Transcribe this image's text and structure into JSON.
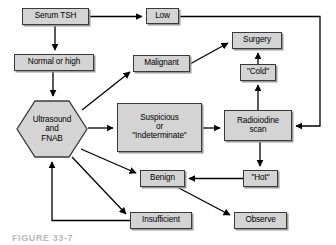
{
  "figure": {
    "caption": "FIGURE 33-7",
    "colors": {
      "node_fill": "#d4d4d4",
      "node_border": "#3a3a3a",
      "edge": "#000000",
      "background": "#ffffff"
    }
  },
  "nodes": [
    {
      "id": "serum-tsh",
      "label": "Serum TSH",
      "shape": "rect",
      "x": 22,
      "y": 8,
      "w": 67,
      "h": 17
    },
    {
      "id": "low",
      "label": "Low",
      "shape": "rect",
      "x": 146,
      "y": 8,
      "w": 33,
      "h": 16
    },
    {
      "id": "normal-or-high",
      "label": "Normal or high",
      "shape": "rect",
      "x": 14,
      "y": 54,
      "w": 80,
      "h": 17
    },
    {
      "id": "malignant",
      "label": "Malignant",
      "shape": "rect",
      "x": 133,
      "y": 55,
      "w": 57,
      "h": 17
    },
    {
      "id": "surgery",
      "label": "Surgery",
      "shape": "rect",
      "x": 232,
      "y": 32,
      "w": 50,
      "h": 17
    },
    {
      "id": "cold",
      "label": "\"Cold\"",
      "shape": "rect",
      "x": 240,
      "y": 64,
      "w": 36,
      "h": 17
    },
    {
      "id": "ultrasound-fnab",
      "label": "Ultrasound\nand\nFNAB",
      "shape": "hexagon",
      "x": 16,
      "y": 100,
      "w": 72,
      "h": 58
    },
    {
      "id": "suspicious",
      "label": "Suspicious\nor\n\"Indeterminate\"",
      "shape": "rect",
      "x": 117,
      "y": 103,
      "w": 85,
      "h": 49
    },
    {
      "id": "radioiodine-scan",
      "label": "Radioiodine\nscan",
      "shape": "rect",
      "x": 224,
      "y": 110,
      "w": 68,
      "h": 31
    },
    {
      "id": "benign",
      "label": "Benign",
      "shape": "rect",
      "x": 140,
      "y": 170,
      "w": 45,
      "h": 17
    },
    {
      "id": "hot",
      "label": "\"Hot\"",
      "shape": "rect",
      "x": 243,
      "y": 170,
      "w": 35,
      "h": 17
    },
    {
      "id": "insufficient",
      "label": "Insufficient",
      "shape": "rect",
      "x": 130,
      "y": 212,
      "w": 62,
      "h": 17
    },
    {
      "id": "observe",
      "label": "Observe",
      "shape": "rect",
      "x": 234,
      "y": 212,
      "w": 53,
      "h": 17
    }
  ],
  "edges": [
    {
      "id": "serum-tsh-to-low",
      "from": "serum-tsh",
      "to": "low",
      "style": "orthogonal"
    },
    {
      "id": "serum-tsh-to-normal-or-high",
      "from": "serum-tsh",
      "to": "normal-or-high",
      "style": "orthogonal"
    },
    {
      "id": "normal-or-high-to-ultrasound",
      "from": "normal-or-high",
      "to": "ultrasound-fnab",
      "style": "orthogonal"
    },
    {
      "id": "ultrasound-to-malignant",
      "from": "ultrasound-fnab",
      "to": "malignant",
      "style": "diagonal"
    },
    {
      "id": "ultrasound-to-suspicious",
      "from": "ultrasound-fnab",
      "to": "suspicious",
      "style": "orthogonal"
    },
    {
      "id": "ultrasound-to-benign",
      "from": "ultrasound-fnab",
      "to": "benign",
      "style": "diagonal"
    },
    {
      "id": "ultrasound-to-insufficient",
      "from": "ultrasound-fnab",
      "to": "insufficient",
      "style": "diagonal"
    },
    {
      "id": "malignant-to-surgery",
      "from": "malignant",
      "to": "surgery",
      "style": "diagonal"
    },
    {
      "id": "suspicious-to-radioiodine",
      "from": "suspicious",
      "to": "radioiodine-scan",
      "style": "orthogonal"
    },
    {
      "id": "low-to-radioiodine",
      "from": "low",
      "to": "radioiodine-scan",
      "style": "orthogonal"
    },
    {
      "id": "radioiodine-to-cold",
      "from": "radioiodine-scan",
      "to": "cold",
      "style": "orthogonal"
    },
    {
      "id": "cold-to-surgery",
      "from": "cold",
      "to": "surgery",
      "style": "orthogonal"
    },
    {
      "id": "radioiodine-to-hot",
      "from": "radioiodine-scan",
      "to": "hot",
      "style": "orthogonal"
    },
    {
      "id": "hot-to-benign",
      "from": "hot",
      "to": "benign",
      "style": "orthogonal"
    },
    {
      "id": "benign-to-observe",
      "from": "benign",
      "to": "observe",
      "style": "diagonal"
    },
    {
      "id": "insufficient-to-ultrasound",
      "from": "insufficient",
      "to": "ultrasound-fnab",
      "style": "orthogonal"
    }
  ]
}
